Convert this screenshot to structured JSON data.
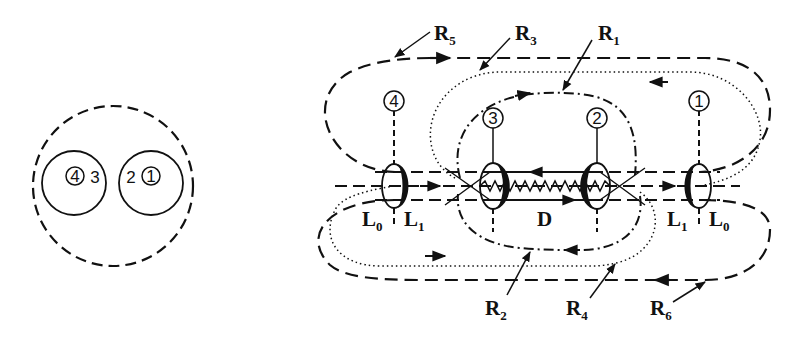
{
  "left_figure": {
    "outer_circle": "dashed",
    "left_pair": {
      "circled": "4",
      "plain": "3"
    },
    "right_pair": {
      "plain": "2",
      "circled": "1"
    }
  },
  "right_figure": {
    "coils": [
      {
        "id": "4",
        "label": "4"
      },
      {
        "id": "3",
        "label": "3"
      },
      {
        "id": "2",
        "label": "2"
      },
      {
        "id": "1",
        "label": "1"
      }
    ],
    "regions": {
      "left_outer": {
        "main": "L",
        "sub": "0"
      },
      "left_inner": {
        "main": "L",
        "sub": "1"
      },
      "center": {
        "main": "D"
      },
      "right_inner": {
        "main": "L",
        "sub": "1"
      },
      "right_outer": {
        "main": "L",
        "sub": "0"
      }
    },
    "loops": [
      {
        "name": "R1",
        "main": "R",
        "sub": "1",
        "style": "dash-dot"
      },
      {
        "name": "R2",
        "main": "R",
        "sub": "2",
        "style": "dash-dot"
      },
      {
        "name": "R3",
        "main": "R",
        "sub": "3",
        "style": "dotted"
      },
      {
        "name": "R4",
        "main": "R",
        "sub": "4",
        "style": "dotted"
      },
      {
        "name": "R5",
        "main": "R",
        "sub": "5",
        "style": "dashed"
      },
      {
        "name": "R6",
        "main": "R",
        "sub": "6",
        "style": "dashed"
      }
    ]
  },
  "colors": {
    "ink": "#111111",
    "background": "#ffffff"
  }
}
